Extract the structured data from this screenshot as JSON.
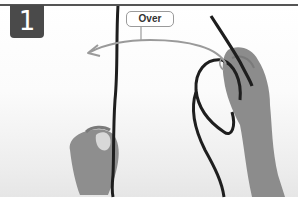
{
  "figure": {
    "step_number": "1",
    "callout_label": "Over",
    "icons": {
      "arrow": "curved-arrow-left-icon",
      "rope": "rope-illustration",
      "left_hand": "left-hand-photo",
      "right_hand": "right-hand-photo"
    },
    "colors": {
      "badge_bg": "#4a4a4a",
      "badge_text": "#ffffff",
      "rule": "#555555",
      "arrow": "#9a9a9a",
      "rope": "#1e1e1e",
      "skin": "#8a8a8a"
    }
  }
}
